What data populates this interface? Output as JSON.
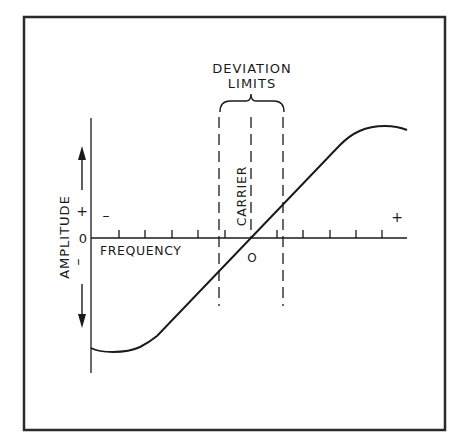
{
  "diagram": {
    "title_line1": "DEVIATION",
    "title_line2": "LIMITS",
    "carrier_label": "CARRIER",
    "x_axis_label": "FREQUENCY",
    "y_axis_label": "AMPLITUDE",
    "y_plus": "+",
    "y_zero": "0",
    "y_minus": "–",
    "x_minus": "–",
    "x_plus": "+",
    "carrier_zero": "O",
    "colors": {
      "ink": "#1a1a1a",
      "background": "#ffffff",
      "frame": "#2a2a2a"
    }
  }
}
